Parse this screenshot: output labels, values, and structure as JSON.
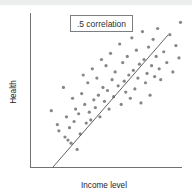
{
  "figure": {
    "name": "scatterplot-figure",
    "background_color": "#ffffff",
    "top_band_color": "#eceded"
  },
  "callout": {
    "label": ".5 correlation",
    "border_color": "#6e7072",
    "text_color": "#2e2f31"
  },
  "axes": {
    "x_label": "Income level",
    "y_label": "Health",
    "axis_color": "#6f7173",
    "x_range_px": [
      30,
      182
    ],
    "y_range_px": [
      13,
      168
    ]
  },
  "chart_data": {
    "type": "scatter",
    "title": "",
    "subtitle": "",
    "xlabel": "Income level",
    "ylabel": "Health",
    "xlim": [
      0,
      100
    ],
    "ylim": [
      0,
      100
    ],
    "grid": false,
    "legend": null,
    "annotations": [
      {
        "text": ".5 correlation",
        "x": 34,
        "y": 93,
        "boxed": true
      }
    ],
    "point_color": "#848688",
    "point_radius": 1.6,
    "series": [
      {
        "name": "observations",
        "marker": "circle",
        "x": [
          14,
          18,
          19,
          22,
          23,
          24,
          25,
          26,
          27,
          28,
          29,
          30,
          31,
          32,
          33,
          34,
          35,
          36,
          37,
          38,
          39,
          40,
          41,
          42,
          43,
          44,
          45,
          46,
          47,
          48,
          49,
          50,
          51,
          52,
          53,
          54,
          55,
          56,
          58,
          59,
          60,
          61,
          62,
          63,
          64,
          65,
          66,
          67,
          68,
          69,
          70,
          71,
          72,
          73,
          74,
          75,
          76,
          77,
          78,
          79,
          80,
          81,
          82,
          83,
          84,
          85,
          86,
          88,
          90,
          92,
          94,
          96,
          98,
          99
        ],
        "y": [
          37,
          28,
          24,
          52,
          20,
          33,
          18,
          26,
          16,
          45,
          30,
          38,
          12,
          35,
          22,
          48,
          60,
          41,
          29,
          55,
          36,
          31,
          64,
          44,
          39,
          58,
          47,
          33,
          70,
          52,
          43,
          66,
          50,
          38,
          74,
          57,
          46,
          62,
          53,
          80,
          41,
          68,
          56,
          49,
          72,
          60,
          45,
          84,
          63,
          51,
          76,
          58,
          67,
          42,
          88,
          70,
          55,
          61,
          78,
          47,
          66,
          83,
          59,
          72,
          90,
          64,
          57,
          75,
          68,
          86,
          62,
          79,
          71,
          94
        ]
      }
    ],
    "trend_line": {
      "label": "regression line",
      "x_start_px": 53,
      "y_start_px": 167,
      "x_end_px": 168,
      "y_end_px": 35,
      "color": "#4d4f52"
    }
  }
}
